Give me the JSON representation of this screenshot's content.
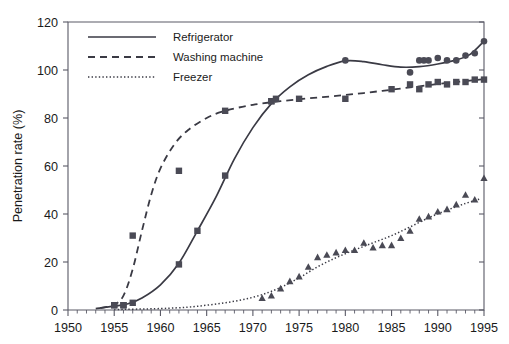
{
  "chart_data": {
    "type": "line",
    "title": "",
    "xlabel": "",
    "ylabel": "Penetration rate (%)",
    "xlim": [
      1950,
      1995
    ],
    "ylim": [
      0,
      120
    ],
    "grid": false,
    "legend_position": "top-left",
    "x_ticks": [
      1950,
      1955,
      1960,
      1965,
      1970,
      1975,
      1980,
      1985,
      1990,
      1995
    ],
    "y_ticks": [
      0,
      20,
      40,
      60,
      80,
      100,
      120
    ],
    "x_minor_tick_step": 1,
    "series": [
      {
        "name": "Refrigerator",
        "line_style": "solid",
        "marker": "square-and-circle",
        "color": "#3a3a44",
        "points": [
          {
            "x": 1955,
            "y": 2
          },
          {
            "x": 1956,
            "y": 2
          },
          {
            "x": 1957,
            "y": 3
          },
          {
            "x": 1962,
            "y": 19
          },
          {
            "x": 1964,
            "y": 33
          },
          {
            "x": 1967,
            "y": 56
          },
          {
            "x": 1972,
            "y": 87
          },
          {
            "x": 1972.5,
            "y": 88
          },
          {
            "x": 1980,
            "y": 104
          },
          {
            "x": 1987,
            "y": 99
          },
          {
            "x": 1988,
            "y": 104
          },
          {
            "x": 1988.5,
            "y": 104
          },
          {
            "x": 1989,
            "y": 104
          },
          {
            "x": 1990,
            "y": 105
          },
          {
            "x": 1991,
            "y": 104
          },
          {
            "x": 1992,
            "y": 104
          },
          {
            "x": 1993,
            "y": 106
          },
          {
            "x": 1994,
            "y": 107
          },
          {
            "x": 1995,
            "y": 112
          }
        ],
        "fit_curve": [
          [
            1953.0,
            0.6
          ],
          [
            1955.0,
            1.6
          ],
          [
            1956.5,
            2.6
          ],
          [
            1958.0,
            5.0
          ],
          [
            1960.0,
            10.5
          ],
          [
            1962.0,
            19.5
          ],
          [
            1964.0,
            33.0
          ],
          [
            1966.0,
            47.0
          ],
          [
            1968.0,
            63.0
          ],
          [
            1970.0,
            76.0
          ],
          [
            1972.0,
            86.0
          ],
          [
            1974.0,
            93.0
          ],
          [
            1976.0,
            98.0
          ],
          [
            1978.0,
            101.5
          ],
          [
            1980.0,
            103.8
          ],
          [
            1982.0,
            103.5
          ],
          [
            1984.0,
            102.2
          ],
          [
            1986.0,
            101.2
          ],
          [
            1988.0,
            101.4
          ],
          [
            1990.0,
            102.5
          ],
          [
            1992.0,
            104.2
          ],
          [
            1993.5,
            106.5
          ],
          [
            1995.0,
            112.0
          ]
        ]
      },
      {
        "name": "Washing machine",
        "line_style": "dashed",
        "marker": "square",
        "color": "#3a3a44",
        "points": [
          {
            "x": 1955,
            "y": 2
          },
          {
            "x": 1956,
            "y": 2
          },
          {
            "x": 1957,
            "y": 31
          },
          {
            "x": 1962,
            "y": 58
          },
          {
            "x": 1967,
            "y": 83
          },
          {
            "x": 1972,
            "y": 87
          },
          {
            "x": 1975,
            "y": 88
          },
          {
            "x": 1980,
            "y": 88
          },
          {
            "x": 1985,
            "y": 92
          },
          {
            "x": 1987,
            "y": 94
          },
          {
            "x": 1988,
            "y": 92
          },
          {
            "x": 1989,
            "y": 94
          },
          {
            "x": 1990,
            "y": 95
          },
          {
            "x": 1991,
            "y": 94
          },
          {
            "x": 1992,
            "y": 95
          },
          {
            "x": 1993,
            "y": 95
          },
          {
            "x": 1994,
            "y": 96
          },
          {
            "x": 1995,
            "y": 96
          }
        ],
        "fit_curve": [
          [
            1953.5,
            0.8
          ],
          [
            1955.0,
            2.2
          ],
          [
            1956.0,
            6.0
          ],
          [
            1957.0,
            17.0
          ],
          [
            1958.0,
            33.0
          ],
          [
            1959.0,
            48.0
          ],
          [
            1960.0,
            59.0
          ],
          [
            1961.5,
            69.0
          ],
          [
            1963.0,
            75.0
          ],
          [
            1965.0,
            80.0
          ],
          [
            1967.0,
            83.0
          ],
          [
            1970.0,
            85.5
          ],
          [
            1973.0,
            87.0
          ],
          [
            1976.0,
            88.2
          ],
          [
            1979.0,
            89.2
          ],
          [
            1982.0,
            90.4
          ],
          [
            1985.0,
            91.8
          ],
          [
            1988.0,
            93.2
          ],
          [
            1991.0,
            94.6
          ],
          [
            1993.0,
            95.4
          ],
          [
            1995.0,
            96.2
          ]
        ]
      },
      {
        "name": "Freezer",
        "line_style": "dotted",
        "marker": "triangle",
        "color": "#3a3a44",
        "points": [
          {
            "x": 1971,
            "y": 5
          },
          {
            "x": 1972,
            "y": 6
          },
          {
            "x": 1973,
            "y": 9
          },
          {
            "x": 1974,
            "y": 12
          },
          {
            "x": 1975,
            "y": 14
          },
          {
            "x": 1976,
            "y": 18
          },
          {
            "x": 1977,
            "y": 22
          },
          {
            "x": 1978,
            "y": 23
          },
          {
            "x": 1979,
            "y": 24
          },
          {
            "x": 1980,
            "y": 25
          },
          {
            "x": 1981,
            "y": 25
          },
          {
            "x": 1982,
            "y": 28
          },
          {
            "x": 1983,
            "y": 26
          },
          {
            "x": 1984,
            "y": 27
          },
          {
            "x": 1985,
            "y": 27
          },
          {
            "x": 1986,
            "y": 30
          },
          {
            "x": 1987,
            "y": 33
          },
          {
            "x": 1988,
            "y": 38
          },
          {
            "x": 1989,
            "y": 39
          },
          {
            "x": 1990,
            "y": 41
          },
          {
            "x": 1991,
            "y": 42
          },
          {
            "x": 1992,
            "y": 44
          },
          {
            "x": 1993,
            "y": 48
          },
          {
            "x": 1994,
            "y": 46
          },
          {
            "x": 1995,
            "y": 55
          }
        ],
        "fit_curve": [
          [
            1955.0,
            0.2
          ],
          [
            1960.0,
            0.6
          ],
          [
            1963.0,
            1.2
          ],
          [
            1965.0,
            2.0
          ],
          [
            1967.0,
            3.0
          ],
          [
            1969.0,
            4.4
          ],
          [
            1971.0,
            6.4
          ],
          [
            1973.0,
            9.4
          ],
          [
            1975.0,
            13.4
          ],
          [
            1977.0,
            18.0
          ],
          [
            1979.0,
            21.8
          ],
          [
            1981.0,
            25.0
          ],
          [
            1983.0,
            28.0
          ],
          [
            1985.0,
            31.0
          ],
          [
            1987.0,
            34.6
          ],
          [
            1989.0,
            38.4
          ],
          [
            1991.0,
            41.6
          ],
          [
            1993.0,
            44.4
          ],
          [
            1994.5,
            46.2
          ]
        ]
      }
    ]
  },
  "axes": {
    "y_title": "Penetration rate (%)",
    "y_tick_labels": [
      "0",
      "20",
      "40",
      "60",
      "80",
      "100",
      "120"
    ],
    "x_tick_labels": [
      "1950",
      "1955",
      "1960",
      "1965",
      "1970",
      "1975",
      "1980",
      "1985",
      "1990",
      "1995"
    ]
  },
  "legend": {
    "items": [
      {
        "label": "Refrigerator",
        "style": "solid"
      },
      {
        "label": "Washing machine",
        "style": "dashed"
      },
      {
        "label": "Freezer",
        "style": "dotted"
      }
    ]
  },
  "colors": {
    "axis": "#5a5a66",
    "series": "#3a3a44",
    "marker": "#4a4a55",
    "text": "#1a1a1a",
    "background": "#ffffff"
  }
}
